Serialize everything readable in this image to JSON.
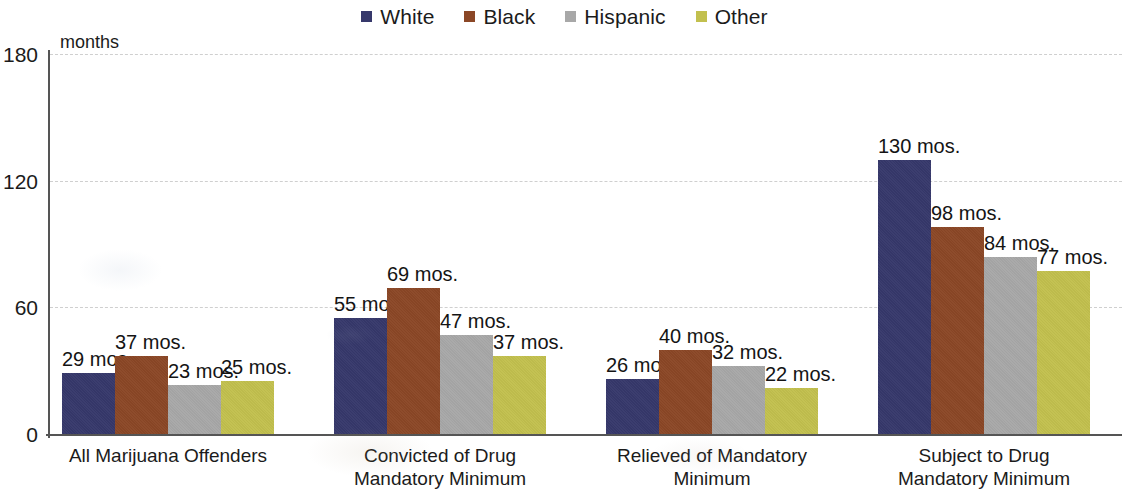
{
  "legend": {
    "items": [
      {
        "label": "White",
        "color": "#36386b"
      },
      {
        "label": "Black",
        "color": "#8b4726"
      },
      {
        "label": "Hispanic",
        "color": "#a8a8a8"
      },
      {
        "label": "Other",
        "color": "#c2c04e"
      }
    ]
  },
  "axis": {
    "unit": "months",
    "y_ticks": [
      "0",
      "60",
      "120",
      "180"
    ]
  },
  "chart_data": {
    "type": "bar",
    "title": "",
    "subtitle": "",
    "xlabel": "",
    "ylabel": "months",
    "ylim": [
      0,
      180
    ],
    "yticks": [
      0,
      60,
      120,
      180
    ],
    "grid": true,
    "legend_position": "top-center",
    "value_suffix": " mos.",
    "categories": [
      "All Marijuana Offenders",
      "Convicted of Drug\nMandatory Minimum",
      "Relieved of Mandatory\nMinimum",
      "Subject to Drug\nMandatory Minimum"
    ],
    "series": [
      {
        "name": "White",
        "color": "#36386b",
        "values": [
          29,
          55,
          26,
          130
        ],
        "labels": [
          "29 mos.",
          "55 mos.",
          "26 mos.",
          "130 mos."
        ]
      },
      {
        "name": "Black",
        "color": "#8b4726",
        "values": [
          37,
          69,
          40,
          98
        ],
        "labels": [
          "37 mos.",
          "69 mos.",
          "40 mos.",
          "98 mos."
        ]
      },
      {
        "name": "Hispanic",
        "color": "#a8a8a8",
        "values": [
          23,
          47,
          32,
          84
        ],
        "labels": [
          "23 mos.",
          "47 mos.",
          "32 mos.",
          "84 mos."
        ]
      },
      {
        "name": "Other",
        "color": "#c2c04e",
        "values": [
          25,
          37,
          22,
          77
        ],
        "labels": [
          "25 mos.",
          "37 mos.",
          "22 mos.",
          "77 mos."
        ]
      }
    ]
  },
  "layout": {
    "plot_left": 48,
    "plot_top": 54,
    "plot_width": 1074,
    "plot_height": 380,
    "bar_width": 53,
    "group_starts": [
      14,
      286,
      558,
      830
    ]
  }
}
